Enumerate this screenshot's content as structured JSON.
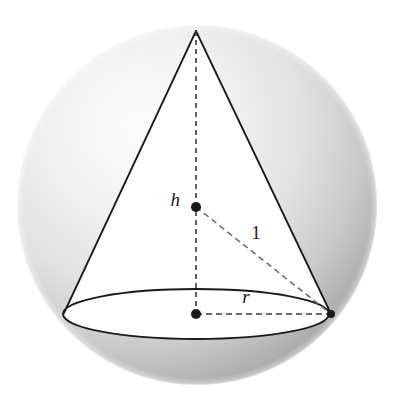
{
  "figure": {
    "name": "cone-inscribed-in-sphere",
    "canvas": {
      "width": 399,
      "height": 406,
      "background": "#ffffff"
    },
    "sphere": {
      "name": "sphere",
      "center": {
        "x": 197,
        "y": 205
      },
      "radius": 180,
      "highlight_color": "#fdfdfd",
      "mid_color": "#dcdcdc",
      "edge_color": "#a9a9a9",
      "highlight_offset": {
        "cx": "34%",
        "cy": "28%"
      }
    },
    "cone": {
      "name": "cone",
      "stroke_color": "#1a1a1a",
      "stroke_width": 1.8,
      "fill_color": "#ffffff",
      "apex": {
        "x": 196,
        "y": 31
      },
      "base_left": {
        "x": 64,
        "y": 313
      },
      "base_right": {
        "x": 331,
        "y": 314
      },
      "base_ellipse": {
        "cx": 196,
        "cy": 314,
        "rx": 133,
        "ry": 25
      }
    },
    "dashed_lines": [
      {
        "name": "height-axis",
        "from": {
          "x": 196,
          "y": 31
        },
        "to": {
          "x": 196,
          "y": 314
        },
        "dash": "5,4",
        "color": "#3a3a3a"
      },
      {
        "name": "sphere-radius-line",
        "from": {
          "x": 196,
          "y": 207
        },
        "to": {
          "x": 331,
          "y": 314
        },
        "dash": "6,4",
        "color": "#6b6b6b"
      },
      {
        "name": "base-radius-line",
        "from": {
          "x": 196,
          "y": 314
        },
        "to": {
          "x": 331,
          "y": 314
        },
        "dash": "6,4",
        "color": "#3a3a3a"
      }
    ],
    "points": [
      {
        "name": "sphere-center-dot",
        "x": 196,
        "y": 207,
        "r": 5,
        "color": "#1a1a1a"
      },
      {
        "name": "base-center-dot",
        "x": 196,
        "y": 314,
        "r": 5,
        "color": "#1a1a1a"
      },
      {
        "name": "base-right-vertex-dot",
        "x": 331,
        "y": 314,
        "r": 4,
        "color": "#1a1a1a"
      }
    ],
    "labels": {
      "height": {
        "text": "h",
        "x": 180,
        "y": 206,
        "size": 19,
        "style": "italic"
      },
      "slant": {
        "text": "1",
        "x": 256,
        "y": 239,
        "size": 19,
        "style": "upright"
      },
      "radius": {
        "text": "r",
        "x": 246,
        "y": 303,
        "size": 19,
        "style": "italic"
      }
    }
  }
}
